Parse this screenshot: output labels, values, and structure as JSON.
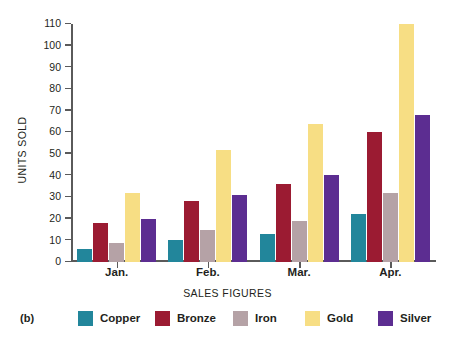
{
  "panel": {
    "tag": "(b)"
  },
  "chart_data": {
    "type": "bar",
    "title": "",
    "xlabel": "SALES FIGURES",
    "ylabel": "UNITS SOLD",
    "categories": [
      "Jan.",
      "Feb.",
      "Mar.",
      "Apr."
    ],
    "series": [
      {
        "name": "Copper",
        "color": "#22869B",
        "values": [
          6,
          10,
          13,
          22
        ]
      },
      {
        "name": "Bronze",
        "color": "#9B1B32",
        "values": [
          18,
          28,
          36,
          60
        ]
      },
      {
        "name": "Iron",
        "color": "#B5A2A6",
        "values": [
          9,
          15,
          19,
          32
        ]
      },
      {
        "name": "Gold",
        "color": "#F7DE84",
        "values": [
          32,
          52,
          64,
          110
        ]
      },
      {
        "name": "Silver",
        "color": "#5C2D91",
        "values": [
          20,
          31,
          40,
          68
        ]
      }
    ],
    "ylim": [
      0,
      110
    ],
    "yticks": [
      0,
      10,
      20,
      30,
      40,
      50,
      60,
      70,
      80,
      90,
      100,
      110
    ],
    "grid": false,
    "legend_position": "bottom"
  }
}
